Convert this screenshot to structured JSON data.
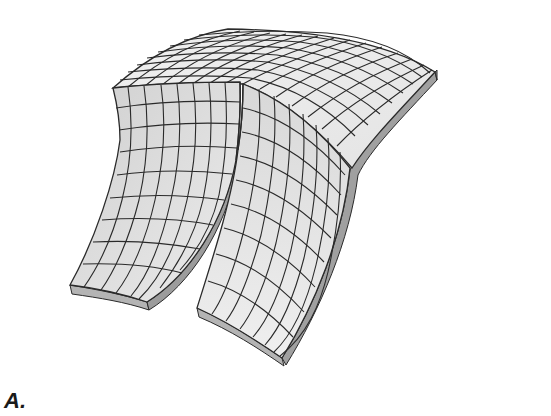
{
  "figure": {
    "panel_label": "A.",
    "colors": {
      "top_surface": "#eeeeee",
      "left_flap": "#dcdcdc",
      "right_flap": "#e6e6e6",
      "edge_thickness": "#a8a8a8",
      "edge_thickness_dark": "#8f8f8f",
      "grid_line": "#2a2a2a"
    }
  }
}
